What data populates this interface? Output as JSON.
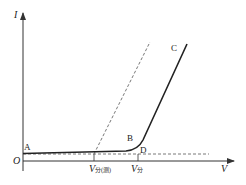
{
  "diagram": {
    "type": "I-V characteristic curve",
    "axes": {
      "y_label": "I",
      "x_label": "V",
      "origin_label": "O"
    },
    "points": {
      "A": "A",
      "B": "B",
      "C": "C",
      "D": "D"
    },
    "ticks": {
      "v_threshold_extrapolated": {
        "main": "V",
        "sub": "分(测)"
      },
      "v_threshold": {
        "main": "V",
        "sub": "分"
      }
    },
    "colors": {
      "axis": "#333333",
      "curve": "#222222",
      "dashed": "#555555"
    }
  }
}
